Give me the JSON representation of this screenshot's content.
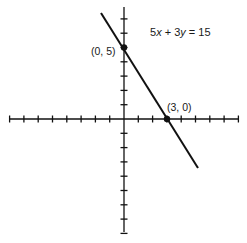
{
  "figure": {
    "equation": {
      "parts": [
        "5",
        "x",
        " + 3",
        "y",
        " = 15"
      ]
    },
    "points": [
      {
        "label": "(0, 5)",
        "x": 0,
        "y": 5
      },
      {
        "label": "(3, 0)",
        "x": 3,
        "y": 0
      }
    ],
    "axes": {
      "x_ticks_left": 8,
      "x_ticks_right": 8,
      "y_ticks_up": 7,
      "y_ticks_down": 8,
      "tick_spacing_px": 14.3
    },
    "colors": {
      "ink": "#111111",
      "background": "#ffffff"
    }
  }
}
